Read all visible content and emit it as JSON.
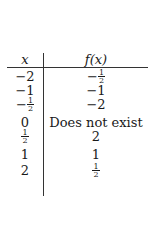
{
  "table": {
    "headers": {
      "x": "x",
      "fx": "f(x)"
    },
    "rows": [
      {
        "x": {
          "sign": "−",
          "num": "2",
          "den": ""
        },
        "fx": {
          "sign": "−",
          "num": "1",
          "den": "2"
        }
      },
      {
        "x": {
          "sign": "−",
          "num": "1",
          "den": ""
        },
        "fx": {
          "sign": "−",
          "num": "1",
          "den": ""
        }
      },
      {
        "x": {
          "sign": "−",
          "num": "1",
          "den": "2"
        },
        "fx": {
          "sign": "−",
          "num": "2",
          "den": ""
        }
      },
      {
        "x": {
          "sign": "",
          "num": "0",
          "den": ""
        },
        "fx": {
          "sign": "",
          "num": "Does not exist",
          "den": ""
        }
      },
      {
        "x": {
          "sign": "",
          "num": "1",
          "den": "2"
        },
        "fx": {
          "sign": "",
          "num": "2",
          "den": ""
        }
      },
      {
        "x": {
          "sign": "",
          "num": "1",
          "den": ""
        },
        "fx": {
          "sign": "",
          "num": "1",
          "den": ""
        }
      },
      {
        "x": {
          "sign": "",
          "num": "2",
          "den": ""
        },
        "fx": {
          "sign": "",
          "num": "1",
          "den": "2"
        }
      }
    ],
    "display": [
      {
        "x": "−2",
        "fx": "−1/2"
      },
      {
        "x": "−1",
        "fx": "−1"
      },
      {
        "x": "−1/2",
        "fx": "−2"
      },
      {
        "x": "0",
        "fx": "Does not exist"
      },
      {
        "x": "1/2",
        "fx": "2"
      },
      {
        "x": "1",
        "fx": "1"
      },
      {
        "x": "2",
        "fx": "1/2"
      }
    ]
  }
}
